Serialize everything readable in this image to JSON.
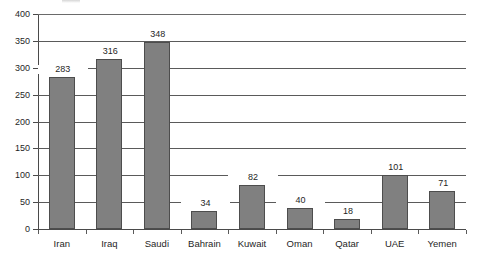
{
  "chart_data": {
    "type": "bar",
    "title": "",
    "xlabel": "",
    "ylabel": "",
    "ylim": [
      0,
      400
    ],
    "yticks": [
      0,
      50,
      100,
      150,
      200,
      250,
      300,
      350,
      400
    ],
    "grid": true,
    "legend": false,
    "show_data_labels": true,
    "categories": [
      "Iran",
      "Iraq",
      "Saudi",
      "Bahrain",
      "Kuwait",
      "Oman",
      "Qatar",
      "UAE",
      "Yemen"
    ],
    "values": [
      283,
      316,
      348,
      34,
      82,
      40,
      18,
      101,
      71
    ],
    "colors": {
      "bar_fill": "#808080",
      "bar_outline": "#4d4d4d",
      "gridline": "#5a5a5a",
      "axis": "#4a4a4a",
      "text": "#1f1f1f",
      "background": "#ffffff"
    }
  }
}
